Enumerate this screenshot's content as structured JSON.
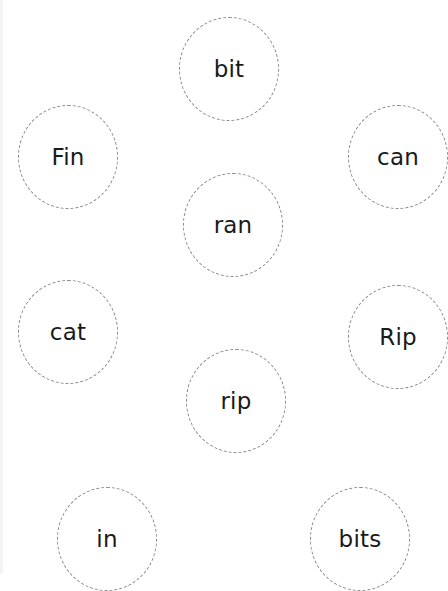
{
  "words": [
    {
      "label": "bit",
      "cx": 229,
      "cy": 69
    },
    {
      "label": "Fin",
      "cx": 68,
      "cy": 157
    },
    {
      "label": "can",
      "cx": 398,
      "cy": 157
    },
    {
      "label": "ran",
      "cx": 233,
      "cy": 225
    },
    {
      "label": "cat",
      "cx": 68,
      "cy": 332
    },
    {
      "label": "Rip",
      "cx": 398,
      "cy": 337
    },
    {
      "label": "rip",
      "cx": 236,
      "cy": 401
    },
    {
      "label": "in",
      "cx": 107,
      "cy": 539
    },
    {
      "label": "bits",
      "cx": 360,
      "cy": 539
    }
  ],
  "style": {
    "circle_border_color": "#8a8a8a",
    "text_color": "#1a1a1a",
    "background": "#ffffff"
  }
}
